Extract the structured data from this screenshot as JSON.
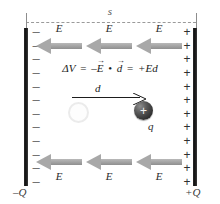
{
  "figure": {
    "name": "parallel-plate-capacitor-potential-difference-diagram",
    "separation_label": "s",
    "equation": {
      "delta_v": "ΔV",
      "equals_1": "=",
      "minus": "–",
      "e_vector": "E",
      "dot": "•",
      "d_vector": "d",
      "equals_2": "=",
      "result": "+Ed",
      "vector_arrow": "→",
      "full_text": "ΔV = –E • d = +Ed"
    },
    "displacement": {
      "label": "d"
    },
    "particle": {
      "charge_sign": "+",
      "label": "q"
    },
    "left_plate": {
      "charge_label": "–Q",
      "sign": "–",
      "sign_count": 12
    },
    "right_plate": {
      "charge_label": "+Q",
      "sign": "+",
      "sign_count": 12
    },
    "field_arrows": {
      "label": "E",
      "top_row": [
        "E",
        "E",
        "E"
      ],
      "bottom_row": [
        "E",
        "E",
        "E"
      ],
      "direction": "left"
    },
    "colors": {
      "plate": "#111111",
      "field_arrow": "#a8a8a8",
      "dimension_line": "#9a9a9a",
      "particle": "#2e2e2e",
      "text": "#1a1a1a",
      "background": "#ffffff"
    }
  }
}
